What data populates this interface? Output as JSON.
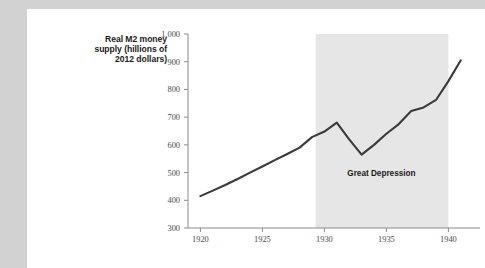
{
  "chart_data": {
    "type": "line",
    "title": "",
    "ylabel": "Real M2 money supply (hillions of 2012 dollars)",
    "ylabel_lines": [
      "Real M2 money",
      "supply (hillions of",
      "2012 dollars)"
    ],
    "xlabel": "",
    "xlim": [
      1919,
      1941.5
    ],
    "ylim": [
      300,
      1000
    ],
    "ytick_labels": [
      "1,000",
      "900",
      "800",
      "700",
      "600",
      "500",
      "400",
      "300"
    ],
    "ytick_values": [
      1000,
      900,
      800,
      700,
      600,
      500,
      400,
      300
    ],
    "xtick_labels": [
      "1920",
      "1925",
      "1930",
      "1935",
      "1940"
    ],
    "xtick_values": [
      1920,
      1925,
      1930,
      1935,
      1940
    ],
    "grid": false,
    "legend": null,
    "series": [
      {
        "name": "Real M2 money supply",
        "color": "#3a3a3a",
        "x": [
          1920,
          1921,
          1922,
          1923,
          1924,
          1925,
          1926,
          1927,
          1928,
          1929,
          1930,
          1931,
          1932,
          1933,
          1934,
          1935,
          1936,
          1937,
          1938,
          1939,
          1940,
          1941
        ],
        "values": [
          415,
          435,
          455,
          477,
          500,
          522,
          545,
          567,
          590,
          628,
          648,
          680,
          620,
          565,
          600,
          640,
          675,
          722,
          735,
          762,
          830,
          905
        ]
      }
    ],
    "annotations": [
      {
        "name": "great-depression-band",
        "label": "Great Depression",
        "type": "vspan",
        "x_start": 1929.3,
        "x_end": 1940.0,
        "color": "#e6e6e6",
        "label_x": 1934.6,
        "label_y": 487
      }
    ]
  }
}
